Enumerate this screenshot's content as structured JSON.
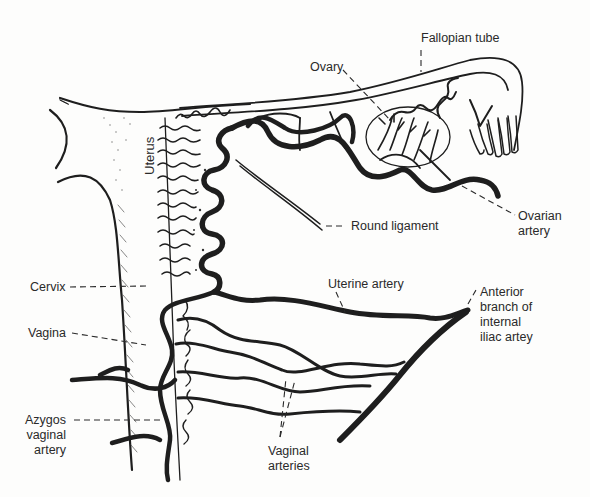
{
  "diagram": {
    "colors": {
      "ink": "#1e1e1e",
      "background": "#fdfdfc",
      "label": "#2a2a2a"
    },
    "labels": {
      "fallopian_tube": "Fallopian tube",
      "ovary": "Ovary",
      "uterus": "Uterus",
      "round_ligament": "Round ligament",
      "ovarian_artery_1": "Ovarian",
      "ovarian_artery_2": "artery",
      "cervix": "Cervix",
      "uterine_artery": "Uterine artery",
      "anterior_branch_1": "Anterior",
      "anterior_branch_2": "branch of",
      "anterior_branch_3": "internal",
      "anterior_branch_4": "iliac artey",
      "vagina": "Vagina",
      "azygos_1": "Azygos",
      "azygos_2": "vaginal",
      "azygos_3": "artery",
      "vaginal_arteries_1": "Vaginal",
      "vaginal_arteries_2": "arteries"
    }
  }
}
